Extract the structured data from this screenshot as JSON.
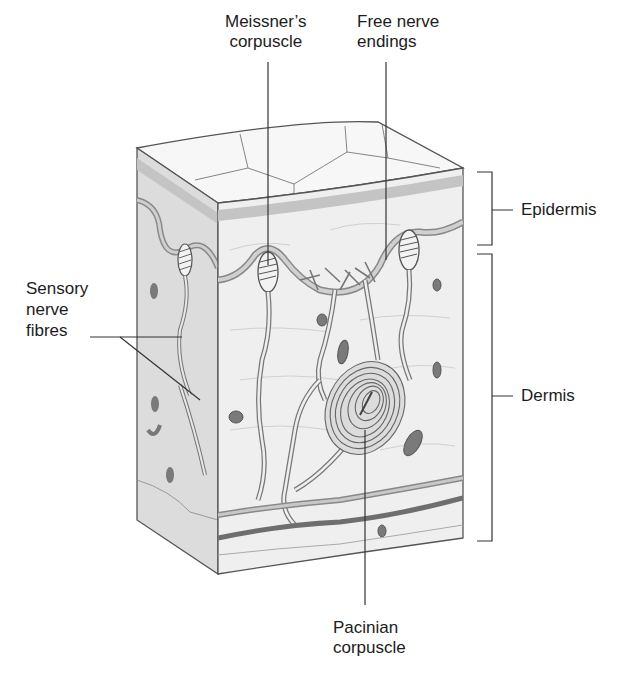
{
  "diagram": {
    "labels": {
      "meissners": {
        "line1": "Meissner’s",
        "line2": "corpuscle"
      },
      "free_nerve": {
        "line1": "Free nerve",
        "line2": "endings"
      },
      "sensory_fibres": {
        "line1": "Sensory",
        "line2": "nerve",
        "line3": "fibres"
      },
      "epidermis": "Epidermis",
      "dermis": "Dermis",
      "pacinian": {
        "line1": "Pacinian",
        "line2": "corpuscle"
      }
    },
    "layers": [
      "Epidermis",
      "Dermis"
    ],
    "colors": {
      "outline": "#555555",
      "block_front": "#efefef",
      "block_side": "#d9d9d9",
      "block_top": "#f7f7f7",
      "epidermis_band": "#c4c4c4",
      "nerve": "#9a9a9a",
      "vessel_dark": "#7a7a7a",
      "label_text": "#1c1c1c"
    }
  }
}
